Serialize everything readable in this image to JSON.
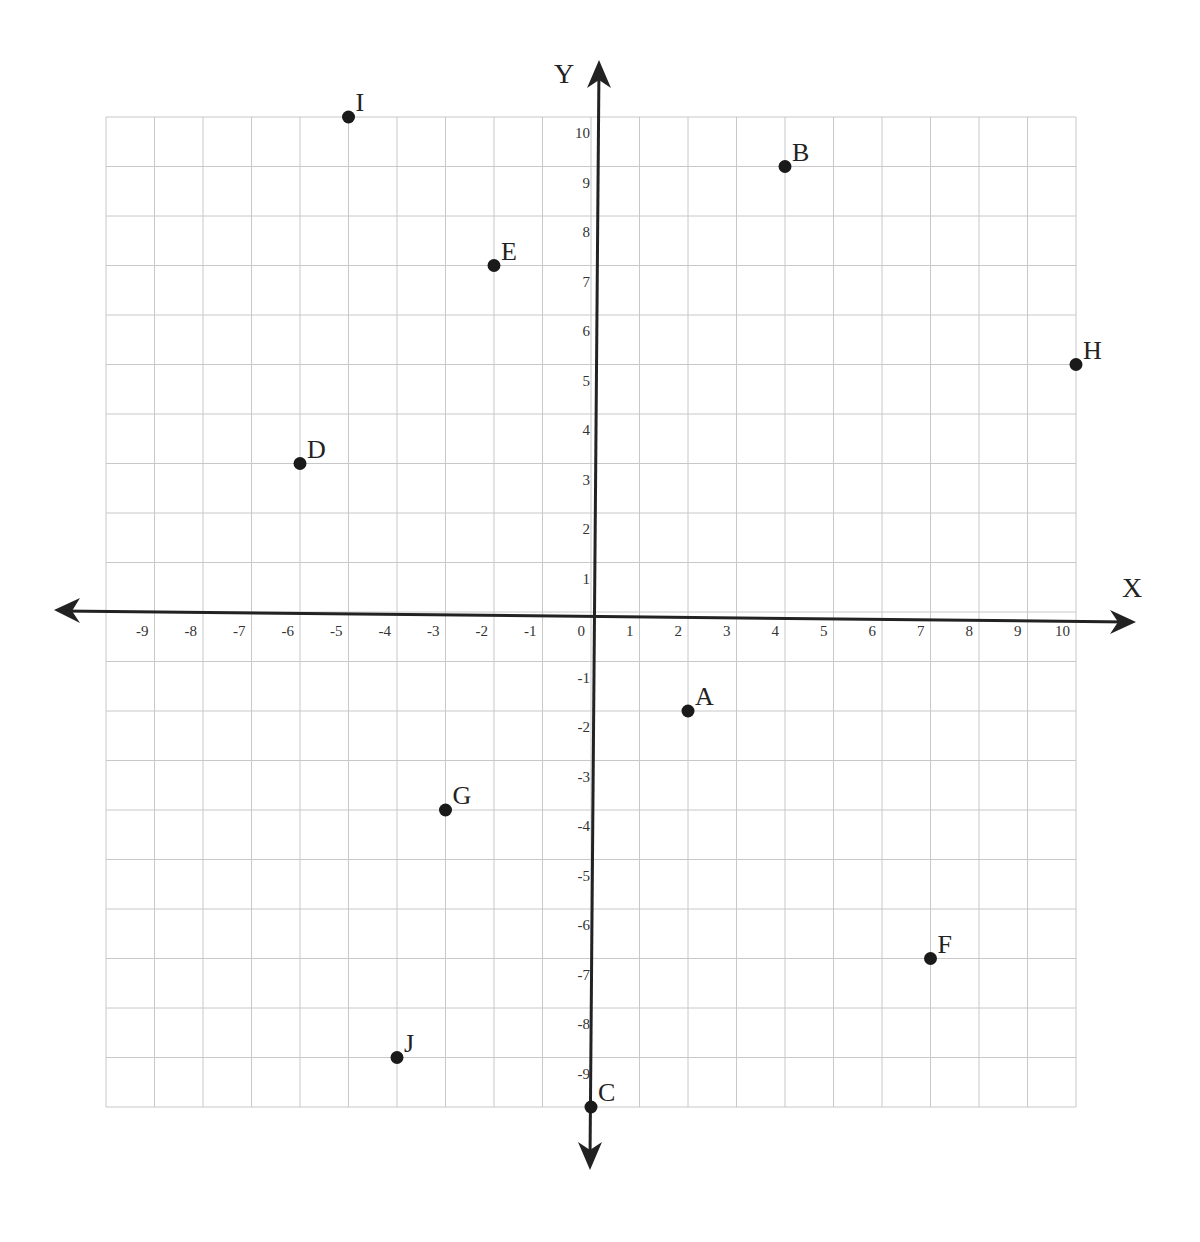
{
  "chart_data": {
    "type": "scatter",
    "title": "",
    "xlabel": "X",
    "ylabel": "Y",
    "xlim": [
      -10,
      10
    ],
    "ylim": [
      -10,
      10
    ],
    "grid": true,
    "legend": null,
    "x_tick_labels": [
      "-9",
      "-8",
      "-7",
      "-6",
      "-5",
      "-4",
      "-3",
      "-2",
      "-1",
      "0",
      "1",
      "2",
      "3",
      "4",
      "5",
      "6",
      "7",
      "8",
      "9",
      "10"
    ],
    "y_tick_labels": [
      "10",
      "9",
      "8",
      "7",
      "6",
      "5",
      "4",
      "3",
      "2",
      "1",
      "-1",
      "-2",
      "-3",
      "-4",
      "-5",
      "-6",
      "-7",
      "-8",
      "-9"
    ],
    "points": [
      {
        "label": "A",
        "x": 2,
        "y": -2
      },
      {
        "label": "B",
        "x": 4,
        "y": 9
      },
      {
        "label": "C",
        "x": 0,
        "y": -10
      },
      {
        "label": "D",
        "x": -6,
        "y": 3
      },
      {
        "label": "E",
        "x": -2,
        "y": 7
      },
      {
        "label": "F",
        "x": 7,
        "y": -7
      },
      {
        "label": "G",
        "x": -3,
        "y": -4
      },
      {
        "label": "H",
        "x": 10,
        "y": 5
      },
      {
        "label": "I",
        "x": -5,
        "y": 10
      },
      {
        "label": "J",
        "x": -4,
        "y": -9
      }
    ]
  },
  "colors": {
    "grid": "#c8c8c8",
    "axis": "#222222",
    "point": "#1a1a1a",
    "text": "#222222"
  }
}
